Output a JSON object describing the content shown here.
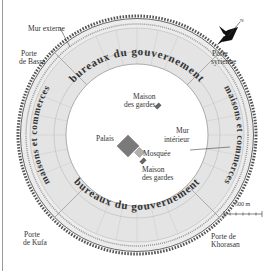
{
  "diagram": {
    "labels": {
      "outer_wall": "Mur externe",
      "gate_basra_1": "Porte",
      "gate_basra_2": "de Basra",
      "gate_syria_1": "Porte",
      "gate_syria_2": "syrienne",
      "gate_kufa_1": "Porte",
      "gate_kufa_2": "de Kufa",
      "gate_khorasan_1": "Porte de",
      "gate_khorasan_2": "Khorasan",
      "guards_top_1": "Maison",
      "guards_top_2": "des gardes",
      "guards_bottom_1": "Maison",
      "guards_bottom_2": "des gardes",
      "palace": "Palais",
      "mosque": "Mosquée",
      "inner_wall_1": "Mur",
      "inner_wall_2": "intérieur",
      "ring_top": "bureaux du gouvernement",
      "ring_bottom": "bureaux du gouvernement",
      "ring_left": "maisons et commerces",
      "ring_right": "maisons et commerces",
      "scale": "500 m",
      "north": "N"
    },
    "colors": {
      "ring_fill": "#e4e4e4",
      "wall": "#555555",
      "palace": "#7a7a7a",
      "mosque": "#a8a8a8",
      "text": "#333333"
    }
  }
}
